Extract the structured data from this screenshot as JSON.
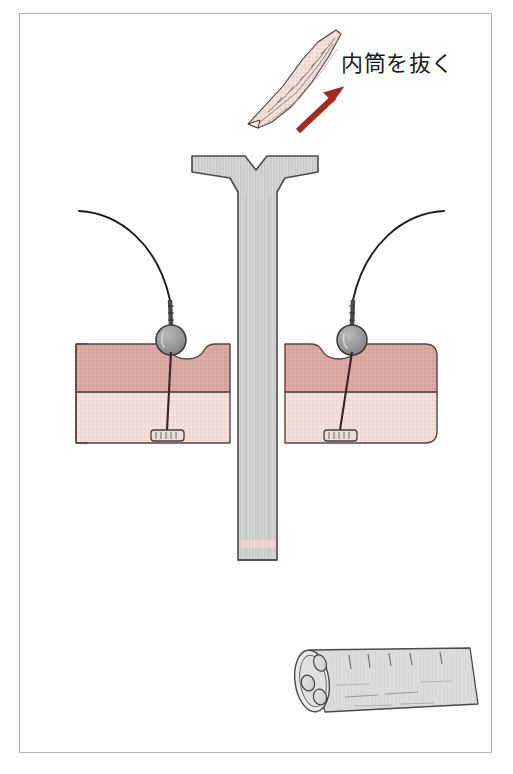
{
  "figure": {
    "title_text": "内筒を抜く",
    "background_color": "#ffffff",
    "frame_border_color": "#b4b4b4"
  },
  "annotations": {
    "pull_inner_tube_label": "内筒を抜く",
    "direction_arrow": {
      "name": "pull-direction-arrow",
      "color": "#a52a1e",
      "points_toward": "upper-right"
    }
  },
  "instruments": {
    "obturator": {
      "name": "obturator-stylet",
      "fill_color": "#f2ddd6",
      "outline_color": "#3c3c3c",
      "description_icon": "pointed-stylet-icon"
    },
    "cannula_sheath": {
      "name": "t-shaped-cannula",
      "fill_color": "#cfd1d0",
      "outline_color": "#4a4a4a",
      "flange_shape": "T-flange-with-v-notch"
    },
    "detached_cannula": {
      "name": "triple-lumen-cannula",
      "fill_color": "#dcdedd",
      "outline_color": "#4a4a4a",
      "lumen_count": 3
    }
  },
  "tissue": {
    "upper_layer": {
      "name": "tissue-upper-layer",
      "color": "#d9a7a2",
      "label": ""
    },
    "lower_layer": {
      "name": "tissue-lower-layer",
      "color": "#f2ded9",
      "label": ""
    },
    "outline_color": "#5a4440"
  },
  "sutures": {
    "thread_color": "#1c1c1c",
    "left": {
      "name": "suture-thread-left",
      "bead": {
        "name": "anchor-bead-left",
        "fill_color": "#9d9d9d"
      },
      "anchor_bar": {
        "name": "t-bar-anchor-left",
        "fill_color": "#e6e0dc"
      }
    },
    "right": {
      "name": "suture-thread-right",
      "bead": {
        "name": "anchor-bead-right",
        "fill_color": "#9d9d9d"
      },
      "anchor_bar": {
        "name": "t-bar-anchor-right",
        "fill_color": "#e6e0dc"
      }
    }
  }
}
